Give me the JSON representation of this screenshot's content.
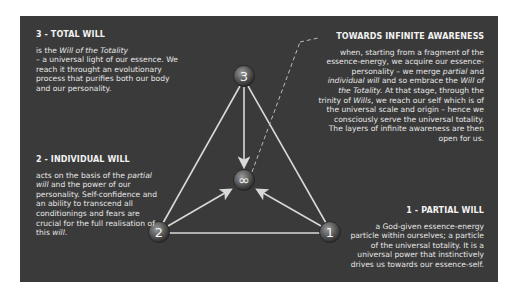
{
  "diagram": {
    "nodes": [
      {
        "id": "3",
        "label": "3",
        "x": 244,
        "y": 76
      },
      {
        "id": "2",
        "label": "2",
        "x": 159,
        "y": 232
      },
      {
        "id": "1",
        "label": "1",
        "x": 330,
        "y": 232
      },
      {
        "id": "center",
        "label": "∞",
        "x": 244,
        "y": 180
      }
    ],
    "edges": [
      {
        "from": "3",
        "to": "2",
        "type": "line"
      },
      {
        "from": "3",
        "to": "1",
        "type": "line"
      },
      {
        "from": "2",
        "to": "1",
        "type": "line"
      },
      {
        "from": "3",
        "to": "center",
        "type": "arrow"
      },
      {
        "from": "2",
        "to": "center",
        "type": "arrow"
      },
      {
        "from": "1",
        "to": "center",
        "type": "arrow"
      },
      {
        "from": "center",
        "to": "towards_infinite",
        "type": "dashed"
      }
    ],
    "colors": {
      "panel": "#3a3a3a",
      "text": "#e6e6e6",
      "line": "#d8d8d8"
    }
  },
  "total_will": {
    "title": "3 - TOTAL WILL",
    "line1_pre": "is the ",
    "line1_em": "Will of the Totality",
    "rest": "– a universal light of our essence. We reach it throught an evolutionary process that purifies both our body and our personality."
  },
  "individual_will": {
    "title": "2 - INDIVIDUAL WILL",
    "t1": "acts on the basis of the ",
    "em1": "partial will",
    "t2": " and the power of our personality. Self-confidence and an ability to transcend all conditionings and fears are crucial for the full realisation of this ",
    "em2": "will",
    "t3": "."
  },
  "towards_infinite": {
    "title": "TOWARDS  INFINITE AWARENESS",
    "t1": "when, starting from a fragment of the essence-energy,  we acquire our essence-personality – we merge ",
    "em1": "partial",
    "t2": " and ",
    "em2": "individual will",
    "t3": " and so embrace the ",
    "em3": "Will of the Totality.",
    "t4": " At that stage, through the trinity of ",
    "em4": "Wills",
    "t5": ", we reach our self which is of the universal scale and origin – hence we consciously serve the universal totality. The layers of infinite awareness are then open for us."
  },
  "partial_will": {
    "title": "1 - PARTIAL WILL",
    "text": "a God-given essence-energy particle within ourselves; a  particle of the universal totality. It is a universal power that instinctively drives us towards our essence-self."
  }
}
